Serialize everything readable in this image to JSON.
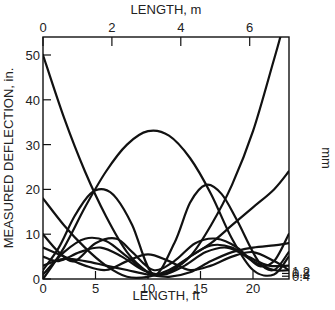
{
  "chart_data": {
    "type": "line",
    "title": "",
    "xlabel": "LENGTH, ft",
    "ylabel": "MEASURED DEFLECTION, in.",
    "x2label": "LENGTH, m",
    "y2label": "mm",
    "xlim": [
      0,
      23.4
    ],
    "ylim": [
      0,
      54
    ],
    "x_ticks": [
      0,
      5,
      10,
      15,
      20
    ],
    "x_tick_labels": [
      "0",
      "5",
      "10",
      "15",
      "20"
    ],
    "y_ticks": [
      0,
      10,
      20,
      30,
      40,
      50
    ],
    "y_tick_labels": [
      "0",
      "10",
      "20",
      "30",
      "40",
      "50"
    ],
    "x2_ticks_m": [
      0,
      2,
      4,
      6
    ],
    "x2_tick_labels": [
      "0",
      "2",
      "4",
      "6"
    ],
    "y2_ticks_mm": [
      0.4,
      0.8,
      1.2
    ],
    "y2_tick_labels": [
      "0.4",
      "0.8",
      "1.2"
    ],
    "grid": false,
    "legend": null,
    "series": [
      {
        "name": "curve-1",
        "x": [
          0,
          2,
          4,
          6,
          8,
          10,
          11,
          12,
          14,
          16,
          18,
          20,
          22,
          22.6
        ],
        "values": [
          50,
          36,
          24,
          14,
          6,
          1.5,
          1,
          1.5,
          5,
          12,
          21,
          33,
          49,
          54
        ]
      },
      {
        "name": "curve-2",
        "x": [
          0,
          2,
          4,
          6,
          8,
          10,
          12,
          14,
          16,
          18,
          20,
          22,
          23.4
        ],
        "values": [
          0,
          7,
          16,
          24,
          30,
          33,
          32,
          27,
          19,
          9,
          2,
          1,
          5
        ]
      },
      {
        "name": "curve-3",
        "x": [
          0,
          1.5,
          3,
          4.5,
          5.8,
          7,
          8.5,
          10.5,
          12.5,
          14,
          15.5,
          17,
          18.5,
          20.5,
          22,
          23.4
        ],
        "values": [
          2,
          7,
          14,
          19,
          20,
          18,
          12,
          1,
          8,
          17,
          21,
          19,
          13,
          4,
          2,
          6
        ]
      },
      {
        "name": "curve-4",
        "x": [
          0,
          2,
          4,
          6,
          8,
          10,
          12,
          14,
          16,
          18,
          20,
          22,
          23.4
        ],
        "values": [
          18,
          12,
          7,
          3,
          0.5,
          0.5,
          2,
          5,
          8,
          12,
          16,
          20,
          24
        ]
      },
      {
        "name": "curve-5",
        "x": [
          0,
          1.5,
          3,
          5,
          7,
          8.5,
          10.5,
          12.5,
          14.5,
          16.5,
          18.5,
          20.5,
          22,
          23.4
        ],
        "values": [
          10,
          6,
          4,
          8,
          9,
          6,
          2,
          4,
          8,
          9,
          7,
          3,
          4,
          10
        ]
      },
      {
        "name": "curve-6",
        "x": [
          0,
          1.5,
          3.5,
          5.5,
          7.5,
          9.5,
          11.5,
          13.5,
          15.5,
          17.5,
          19.5,
          21.5,
          23.4
        ],
        "values": [
          5,
          4,
          6,
          7,
          5,
          2,
          1,
          3,
          6,
          7,
          5,
          3,
          3
        ]
      },
      {
        "name": "curve-7",
        "x": [
          0,
          2,
          4,
          6,
          8,
          10,
          12,
          14,
          16,
          18,
          20,
          22,
          23.4
        ],
        "values": [
          1,
          6,
          9,
          8.5,
          5,
          1.5,
          1.5,
          5,
          7.5,
          7,
          4,
          2,
          2
        ]
      },
      {
        "name": "curve-8",
        "x": [
          0,
          2,
          4,
          6,
          8,
          10,
          12,
          14,
          16,
          18,
          20,
          22,
          23.4
        ],
        "values": [
          7,
          5,
          3,
          2,
          4,
          5.5,
          4,
          2,
          3,
          5,
          6,
          4,
          2
        ]
      },
      {
        "name": "curve-9",
        "x": [
          0,
          2,
          4,
          6,
          8,
          10,
          12,
          14,
          16,
          18,
          20,
          22,
          23.4
        ],
        "values": [
          3,
          4.5,
          4,
          3,
          2,
          1,
          0.5,
          1.5,
          4,
          6,
          7,
          7.5,
          8
        ]
      }
    ]
  },
  "labels": {
    "x_bottom": "LENGTH, ft",
    "x_top": "LENGTH, m",
    "y_left": "MEASURED DEFLECTION, in.",
    "y_right": "mm"
  }
}
